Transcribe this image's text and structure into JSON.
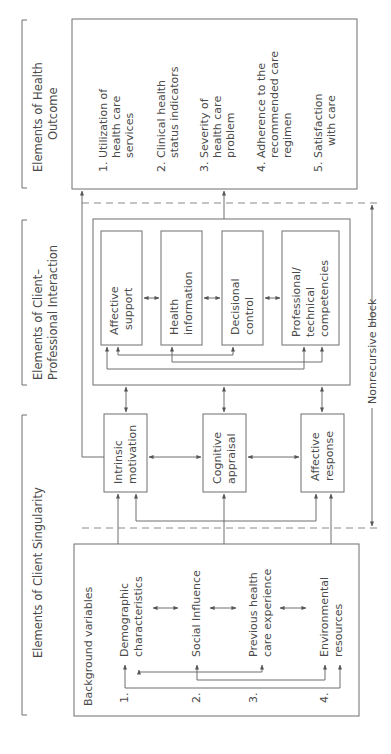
{
  "headers": {
    "outcome": [
      "Elements of Health",
      "Outcome"
    ],
    "interaction": [
      "Elements of Client–",
      "Professional Interaction"
    ],
    "singularity": [
      "Elements of Client Singularity"
    ]
  },
  "outcomes": {
    "items": [
      {
        "num": "1.",
        "lines": [
          "Utilization of",
          "health care",
          "services"
        ]
      },
      {
        "num": "2.",
        "lines": [
          "Clinical health",
          "status indicators"
        ]
      },
      {
        "num": "3.",
        "lines": [
          "Severity of",
          "health care",
          "problem"
        ]
      },
      {
        "num": "4.",
        "lines": [
          "Adherence to the",
          "recommended care",
          "regimen"
        ]
      },
      {
        "num": "5.",
        "lines": [
          "Satisfaction",
          "with care"
        ]
      }
    ]
  },
  "interaction": {
    "boxes": [
      {
        "lines": [
          "Affective",
          "support"
        ]
      },
      {
        "lines": [
          "Health",
          "information"
        ]
      },
      {
        "lines": [
          "Decisional",
          "control"
        ]
      },
      {
        "lines": [
          "Professional/",
          "technical",
          "competencies"
        ]
      }
    ]
  },
  "singularity": {
    "boxes": [
      {
        "lines": [
          "Intrinsic",
          "motivation"
        ]
      },
      {
        "lines": [
          "Cognitive",
          "appraisal"
        ]
      },
      {
        "lines": [
          "Affective",
          "response"
        ]
      }
    ]
  },
  "background": {
    "title": "Background variables",
    "items": [
      {
        "num": "1.",
        "lines": [
          "Demographic",
          "characteristics"
        ]
      },
      {
        "num": "2.",
        "lines": [
          "Social Influence"
        ]
      },
      {
        "num": "3.",
        "lines": [
          "Previous health",
          "care experience"
        ]
      },
      {
        "num": "4.",
        "lines": [
          "Environmental",
          "resources"
        ]
      }
    ]
  },
  "nonrecursive_label": "Nonrecursive block"
}
